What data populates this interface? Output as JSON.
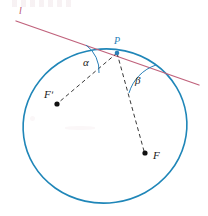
{
  "figure": {
    "type": "geometry-diagram",
    "background_color": "#ffffff",
    "canvas": {
      "width": 208,
      "height": 216
    }
  },
  "colors": {
    "ellipse_stroke": "#1f86b8",
    "tangent_stroke": "#c0627c",
    "dashed_stroke": "#232323",
    "arc_stroke": "#2a7fb8",
    "point_fill": "#111111",
    "p_label_color": "#2a7fb8"
  },
  "labels": {
    "line_l": "l",
    "point_P": "P",
    "angle_alpha": "α",
    "angle_beta": "β",
    "focus_F_prime": "Fʹ",
    "focus_F": "F"
  },
  "geometry": {
    "ellipse": {
      "center_x": 105,
      "center_y": 126,
      "radius_x": 82,
      "radius_y": 77,
      "rotation_deg": -8,
      "stroke_width": 1.6
    },
    "tangent_line": {
      "x1": 16,
      "y1": 21,
      "x2": 199,
      "y2": 85,
      "stroke_width": 1.3
    },
    "tangent_point_P": {
      "x": 117,
      "y": 53
    },
    "focus_F_prime": {
      "x": 57,
      "y": 104,
      "dot_radius": 2.6
    },
    "focus_F": {
      "x": 145,
      "y": 153,
      "dot_radius": 2.6
    },
    "segment_P_to_F_prime": {
      "x1": 117,
      "y1": 53,
      "x2": 58,
      "y2": 103,
      "dash": "4 3"
    },
    "segment_P_to_F": {
      "x1": 117,
      "y1": 53,
      "x2": 144,
      "y2": 151,
      "dash": "4 3"
    },
    "arc_alpha": {
      "start_x": 86,
      "start_y": 45,
      "end_x": 99,
      "end_y": 73,
      "radius": 32
    },
    "arc_beta": {
      "start_x": 129,
      "start_y": 93,
      "end_x": 156,
      "end_y": 65,
      "radius": 42
    }
  }
}
